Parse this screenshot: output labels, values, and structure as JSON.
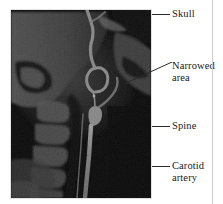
{
  "figure": {
    "modality": "angiogram",
    "background_color": "#ffffff",
    "scan_background_color": "#0a0a0a"
  },
  "scan": {
    "alt": "lateral neck angiogram showing skull, cervical spine and carotid artery with a narrowed area",
    "label": "neck-angiogram"
  },
  "annotations": [
    {
      "id": "skull",
      "text": "Skull",
      "leader": "horizontal",
      "icon": "leader-line-icon"
    },
    {
      "id": "narrowed",
      "text": "Narrowed\narea",
      "leader": "diagonal",
      "icon": "leader-line-icon"
    },
    {
      "id": "spine",
      "text": "Spine",
      "leader": "horizontal",
      "icon": "leader-line-icon"
    },
    {
      "id": "carotid",
      "text": "Carotid\nartery",
      "leader": "horizontal",
      "icon": "leader-line-icon"
    }
  ]
}
